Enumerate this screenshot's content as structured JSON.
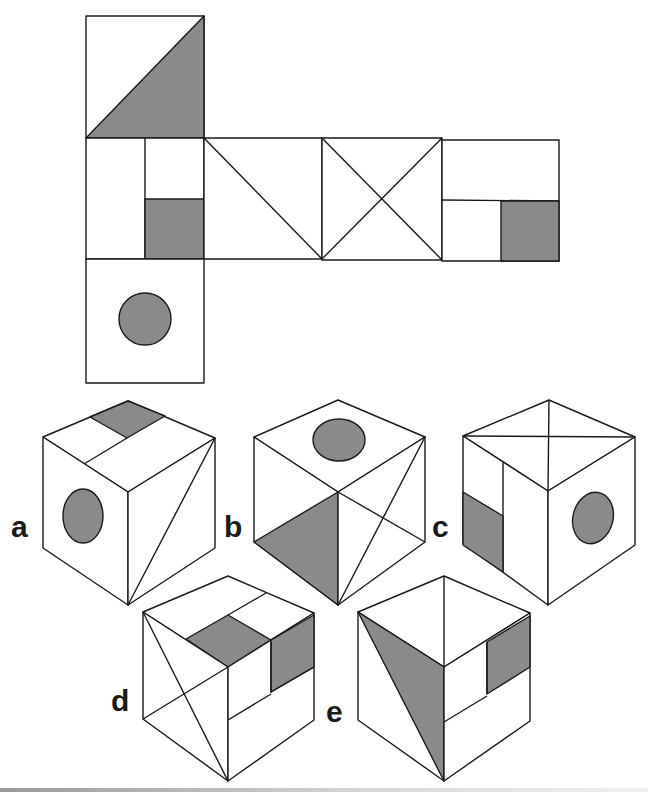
{
  "puzzle": {
    "description": "Cube net folding puzzle: which cube can be made from the net?",
    "colors": {
      "line": "#1a1a1a",
      "shade": "#8a8a8a",
      "background": "#ffffff"
    },
    "net": {
      "faces": [
        {
          "id": "top",
          "pattern": "diagonal-half-shaded"
        },
        {
          "id": "left",
          "pattern": "vertical-split-with-shaded-quarter"
        },
        {
          "id": "center-1",
          "pattern": "single-diagonal"
        },
        {
          "id": "center-2",
          "pattern": "x-diagonals"
        },
        {
          "id": "right",
          "pattern": "horizontal-split-with-shaded-quarter"
        },
        {
          "id": "bottom",
          "pattern": "shaded-circle"
        }
      ]
    },
    "options": [
      {
        "label": "a"
      },
      {
        "label": "b"
      },
      {
        "label": "c"
      },
      {
        "label": "d"
      },
      {
        "label": "e"
      }
    ]
  }
}
